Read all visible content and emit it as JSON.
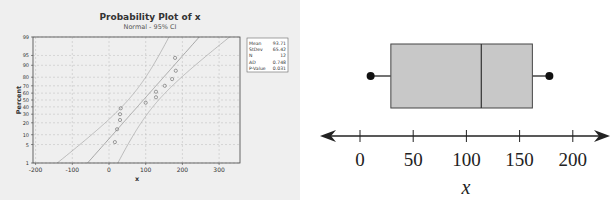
{
  "chart_data": [
    {
      "type": "scatter",
      "title": "Probability Plot of x",
      "subtitle": "Normal - 95% CI",
      "xlabel": "x",
      "ylabel": "Percent",
      "xlim": [
        -200,
        350
      ],
      "x_ticks": [
        -200,
        -100,
        0,
        100,
        200,
        300
      ],
      "y_ticks": [
        1,
        5,
        10,
        20,
        30,
        40,
        50,
        60,
        70,
        80,
        90,
        95,
        99
      ],
      "y_scale": "normal-probability",
      "grid": true,
      "points": [
        {
          "x": 16,
          "y": 6
        },
        {
          "x": 22,
          "y": 14
        },
        {
          "x": 30,
          "y": 23
        },
        {
          "x": 30,
          "y": 30
        },
        {
          "x": 32,
          "y": 38
        },
        {
          "x": 100,
          "y": 46
        },
        {
          "x": 128,
          "y": 54
        },
        {
          "x": 128,
          "y": 62
        },
        {
          "x": 152,
          "y": 70
        },
        {
          "x": 172,
          "y": 78
        },
        {
          "x": 182,
          "y": 86
        },
        {
          "x": 180,
          "y": 94
        }
      ],
      "fit_line": {
        "mean": 93.71,
        "stdev": 65.42
      },
      "legend": [
        {
          "label": "Mean",
          "value": "93.71"
        },
        {
          "label": "StDev",
          "value": "65.42"
        },
        {
          "label": "N",
          "value": "12"
        },
        {
          "label": "AD",
          "value": "0.748"
        },
        {
          "label": "P-Value",
          "value": "0.031"
        }
      ],
      "legend_position": "right"
    },
    {
      "type": "boxplot",
      "title": "",
      "xlabel": "x",
      "x_ticks": [
        0,
        50,
        100,
        150,
        200
      ],
      "xlim": [
        -20,
        230
      ],
      "min": 10,
      "q1": 29,
      "median": 114,
      "q3": 162,
      "max": 178
    }
  ],
  "left": {
    "title": "Probability Plot of x",
    "subtitle": "Normal - 95% CI",
    "xlabel": "x",
    "ylabel": "Percent",
    "legend": {
      "labels": [
        "Mean",
        "StDev",
        "N",
        "AD",
        "P-Value"
      ],
      "values": [
        "93.71",
        "65.42",
        "12",
        "0.748",
        "0.031"
      ]
    }
  },
  "right": {
    "xlabel": "x",
    "ticks": [
      "0",
      "50",
      "100",
      "150",
      "200"
    ]
  }
}
